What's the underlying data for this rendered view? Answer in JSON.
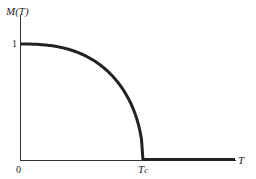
{
  "chart_data": {
    "type": "line",
    "title": "",
    "xlabel": "T",
    "ylabel": "M(T)",
    "x_ticks": [
      "0",
      "T_c"
    ],
    "y_ticks": [
      "1"
    ],
    "x": [
      0,
      0.2,
      0.4,
      0.6,
      0.8,
      0.9,
      0.95,
      1.0,
      1.2,
      1.5,
      1.75
    ],
    "series": [
      {
        "name": "M(T)",
        "values": [
          1.0,
          0.98,
          0.92,
          0.8,
          0.6,
          0.44,
          0.31,
          0.0,
          0.0,
          0.0,
          0.0
        ]
      }
    ],
    "xlim": [
      0,
      1.8
    ],
    "ylim": [
      0,
      1.2
    ],
    "grid": false,
    "legend": "none",
    "annotations": [
      "Tc marks critical temperature where magnetization drops to zero"
    ]
  },
  "labels": {
    "ylabel": "M(T)",
    "ytick_one": "1",
    "origin": "0",
    "xlabel": "T",
    "tc_main": "T",
    "tc_sub": "c"
  }
}
